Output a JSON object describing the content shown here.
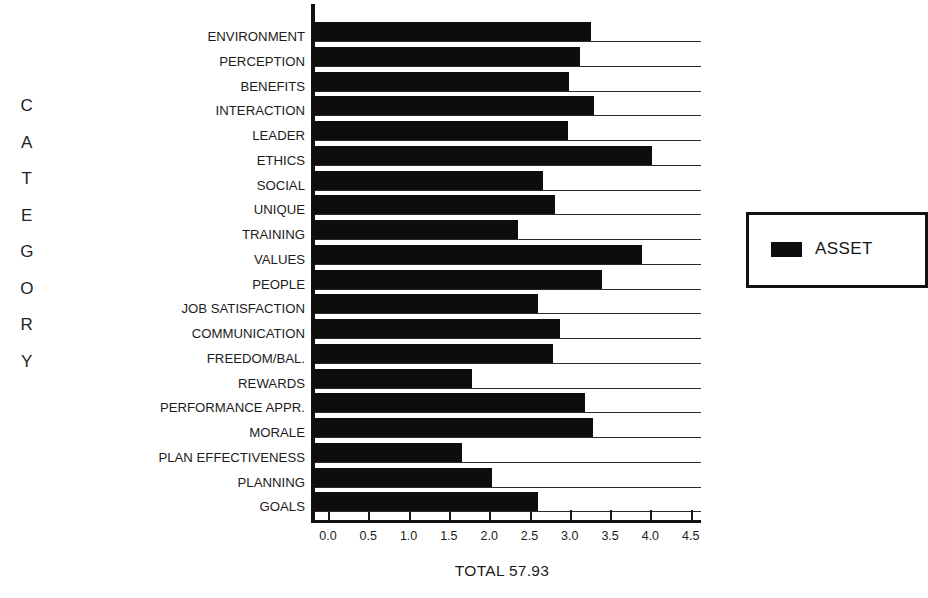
{
  "chart_data": {
    "type": "bar",
    "orientation": "horizontal",
    "title": "",
    "xlabel": "",
    "ylabel": "CATEGORY",
    "caption": "TOTAL 57.93",
    "xlim": [
      0.0,
      4.5
    ],
    "xticks": [
      "0.0",
      "0.5",
      "1.0",
      "1.5",
      "2.0",
      "2.5",
      "3.0",
      "3.5",
      "4.0",
      "4.5"
    ],
    "grid": true,
    "legend_position": "right",
    "series": [
      {
        "name": "ASSET",
        "color": "#0d0d0d",
        "values": [
          3.26,
          3.13,
          2.99,
          3.3,
          2.98,
          4.02,
          2.67,
          2.82,
          2.36,
          3.9,
          3.4,
          2.6,
          2.88,
          2.79,
          1.79,
          3.19,
          3.29,
          1.66,
          2.03,
          2.6
        ]
      }
    ],
    "categories": [
      "ENVIRONMENT",
      "PERCEPTION",
      "BENEFITS",
      "INTERACTION",
      "LEADER",
      "ETHICS",
      "SOCIAL",
      "UNIQUE",
      "TRAINING",
      "VALUES",
      "PEOPLE",
      "JOB SATISFACTION",
      "COMMUNICATION",
      "FREEDOM/BAL.",
      "REWARDS",
      "PERFORMANCE APPR.",
      "MORALE",
      "PLAN EFFECTIVENESS",
      "PLANNING",
      "GOALS"
    ]
  },
  "axis_title_letters": [
    "C",
    "A",
    "T",
    "E",
    "G",
    "O",
    "R",
    "Y"
  ],
  "legend": {
    "entries": [
      {
        "label": "ASSET",
        "color": "#0d0d0d"
      }
    ]
  },
  "total_caption": "TOTAL 57.93"
}
